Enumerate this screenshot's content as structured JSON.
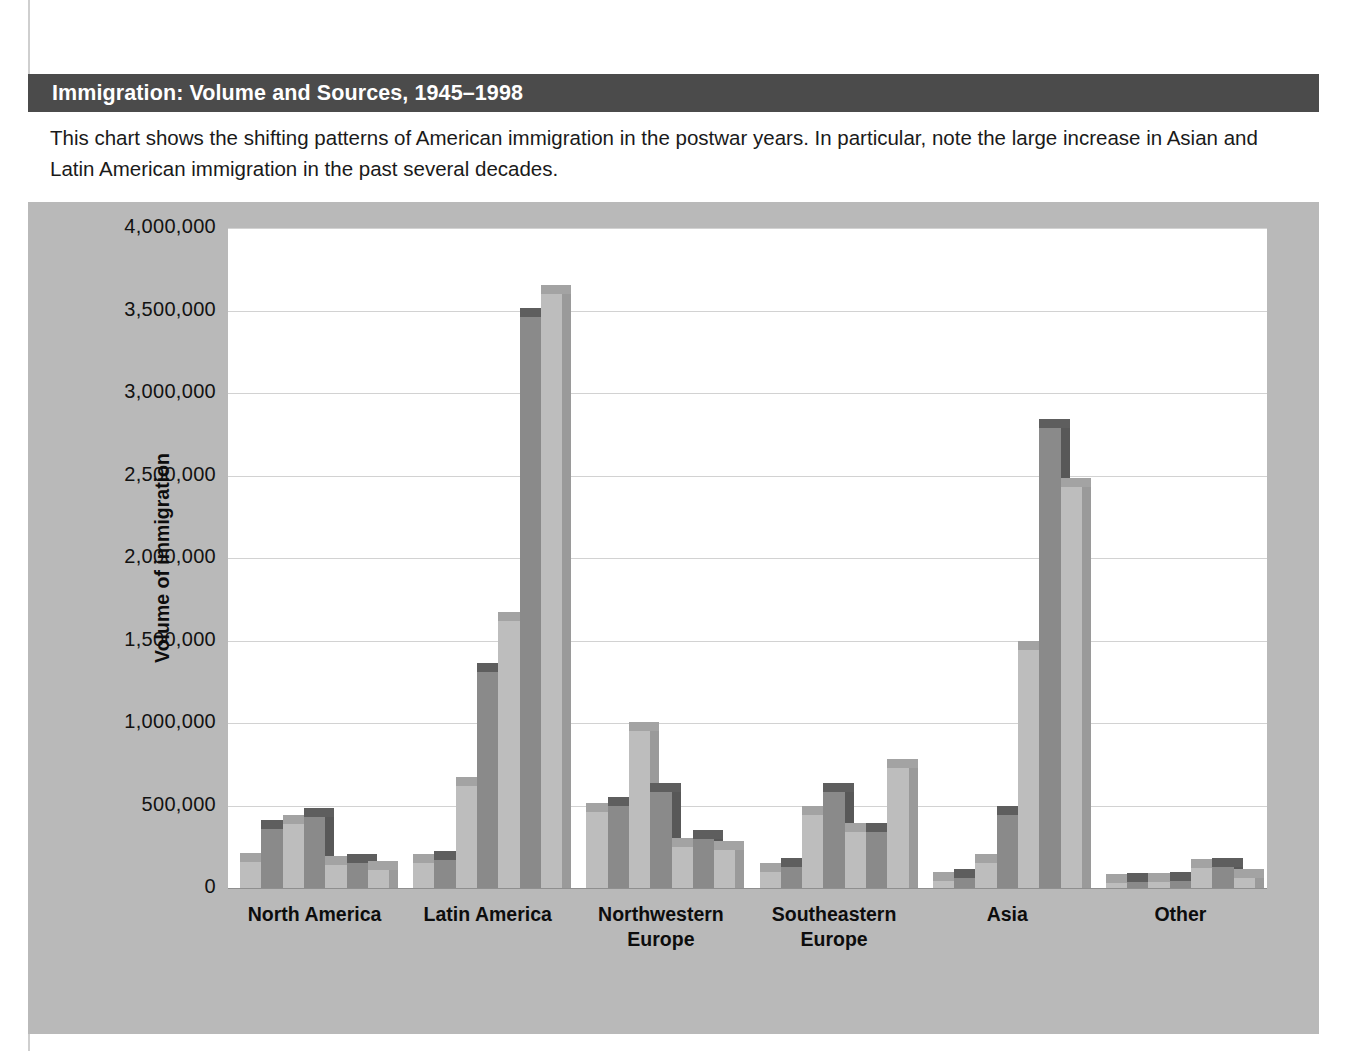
{
  "figure": {
    "title": "Immigration: Volume and Sources, 1945–1998",
    "caption": "This chart shows the shifting patterns of American immigration in the postwar years. In particular, note the large increase in Asian and Latin American immigration in the past several decades."
  },
  "colors": {
    "title_bar": "#4b4b4b",
    "panel_background": "#b9b9b9",
    "plot_background": "#ffffff",
    "gridline": "#d2d2d2",
    "bar_light": "#bdbdbd",
    "bar_light_top": "#a3a3a3",
    "bar_light_side": "#9a9a9a",
    "bar_dark": "#8a8a8a",
    "bar_dark_top": "#5e5e5e",
    "bar_dark_side": "#585858",
    "text": "#0d0d0d"
  },
  "chart_data": {
    "type": "bar",
    "title": "Immigration: Volume and Sources, 1945–1998",
    "xlabel": "",
    "ylabel": "Volume of immigration",
    "ylim": [
      0,
      4000000
    ],
    "ytick_labels": [
      "4,000,000",
      "3,500,000",
      "3,000,000",
      "2,500,000",
      "2,000,000",
      "1,500,000",
      "1,000,000",
      "500,000",
      "0"
    ],
    "ytick_values": [
      4000000,
      3500000,
      3000000,
      2500000,
      2000000,
      1500000,
      1000000,
      500000,
      0
    ],
    "grid": true,
    "legend_position": "none",
    "categories": [
      "North America",
      "Latin America",
      "Northwestern Europe",
      "Southeastern Europe",
      "Asia",
      "Other"
    ],
    "category_label_lines": [
      [
        "North America"
      ],
      [
        "Latin America"
      ],
      [
        "Northwestern",
        "Europe"
      ],
      [
        "Southeastern",
        "Europe"
      ],
      [
        "Asia"
      ],
      [
        "Other"
      ]
    ],
    "series": [
      {
        "name": "Period 1",
        "shade": "light",
        "values": [
          160000,
          150000,
          460000,
          100000,
          40000,
          30000
        ]
      },
      {
        "name": "Period 2",
        "shade": "dark",
        "values": [
          360000,
          170000,
          500000,
          130000,
          60000,
          35000
        ]
      },
      {
        "name": "Period 3",
        "shade": "light",
        "values": [
          390000,
          620000,
          950000,
          440000,
          150000,
          35000
        ]
      },
      {
        "name": "Period 4",
        "shade": "dark",
        "values": [
          430000,
          1310000,
          580000,
          580000,
          440000,
          40000
        ]
      },
      {
        "name": "Period 5",
        "shade": "light",
        "values": [
          140000,
          1620000,
          250000,
          340000,
          1440000,
          120000
        ]
      },
      {
        "name": "Period 6",
        "shade": "dark",
        "values": [
          150000,
          3460000,
          300000,
          340000,
          2790000,
          130000
        ]
      },
      {
        "name": "Period 7",
        "shade": "light",
        "values": [
          110000,
          3600000,
          230000,
          730000,
          2430000,
          60000
        ]
      }
    ]
  }
}
